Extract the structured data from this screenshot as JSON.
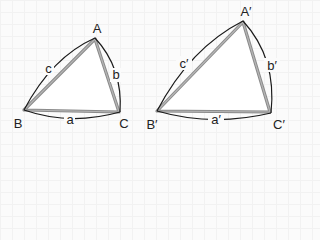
{
  "diagram": {
    "colors": {
      "background": "#fbfbfb",
      "triangle_edge": "#8a8a8a",
      "arc": "#1a1a1a",
      "text": "#222222"
    },
    "triangles": [
      {
        "name": "triangle-ABC",
        "vertices": {
          "A": {
            "label": "A"
          },
          "B": {
            "label": "B"
          },
          "C": {
            "label": "C"
          }
        },
        "sides": {
          "a": {
            "label": "a"
          },
          "b": {
            "label": "b"
          },
          "c": {
            "label": "c"
          }
        }
      },
      {
        "name": "triangle-A'B'C'",
        "vertices": {
          "A": {
            "label": "A′"
          },
          "B": {
            "label": "B′"
          },
          "C": {
            "label": "C′"
          }
        },
        "sides": {
          "a": {
            "label": "a′"
          },
          "b": {
            "label": "b′"
          },
          "c": {
            "label": "c′"
          }
        }
      }
    ]
  }
}
